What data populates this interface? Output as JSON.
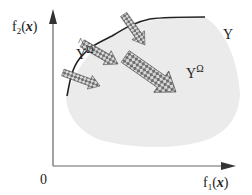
{
  "axes": {
    "y_label": {
      "base": "f",
      "sub": "2",
      "arg": "x"
    },
    "x_label": {
      "base": "f",
      "sub": "1",
      "arg": "x"
    },
    "origin": "0"
  },
  "regions": {
    "objective_space": "Y",
    "reachable_set": {
      "base": "Y",
      "sup": "Ω"
    },
    "estimated_front": {
      "base": "Y",
      "sup": "Ω",
      "accent": "^"
    }
  },
  "arrows": {
    "count": 4,
    "direction": "toward upper-left (minimization toward front)"
  },
  "colors": {
    "axis": "#555555",
    "front_curve": "#222222",
    "region_fill": "#e6e6e6",
    "arrow_fill": "#7a7a7a"
  }
}
